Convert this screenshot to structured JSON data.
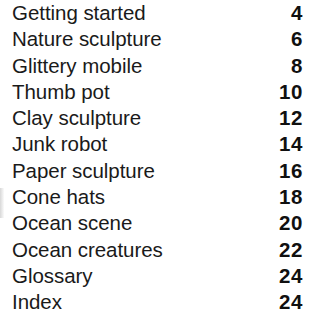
{
  "document": {
    "type": "table-of-contents",
    "background_color": "#ffffff",
    "title_color": "#1a1a1a",
    "page_number_color": "#101010"
  },
  "entries": [
    {
      "title": "Getting started",
      "page": "4"
    },
    {
      "title": "Nature sculpture",
      "page": "6"
    },
    {
      "title": "Glittery mobile",
      "page": "8"
    },
    {
      "title": "Thumb pot",
      "page": "10"
    },
    {
      "title": "Clay sculpture",
      "page": "12"
    },
    {
      "title": "Junk robot",
      "page": "14"
    },
    {
      "title": "Paper sculpture",
      "page": "16"
    },
    {
      "title": "Cone hats",
      "page": "18"
    },
    {
      "title": "Ocean scene",
      "page": "20"
    },
    {
      "title": "Ocean creatures",
      "page": "22"
    },
    {
      "title": "Glossary",
      "page": "24"
    },
    {
      "title": "Index",
      "page": "24"
    }
  ]
}
